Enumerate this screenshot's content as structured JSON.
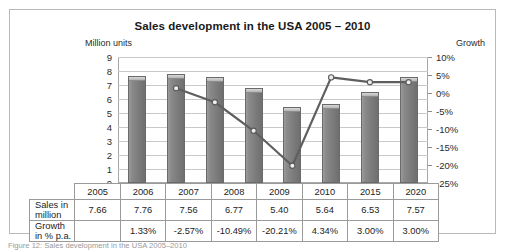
{
  "chart_data": {
    "type": "bar",
    "title": "Sales development in the USA 2005 – 2010",
    "categories": [
      "2005",
      "2006",
      "2007",
      "2008",
      "2009",
      "2010",
      "2015",
      "2020"
    ],
    "series": [
      {
        "name": "Sales in million",
        "type": "bar",
        "axis": "left",
        "values": [
          7.66,
          7.76,
          7.56,
          6.77,
          5.4,
          5.64,
          6.53,
          7.57
        ],
        "labels": [
          "7.66",
          "7.76",
          "7.56",
          "6.77",
          "5.40",
          "5.64",
          "6.53",
          "7.57"
        ],
        "color": "#7d7d7d"
      },
      {
        "name": "Growth in % p.a.",
        "type": "line",
        "axis": "right",
        "values": [
          null,
          1.33,
          -2.57,
          -10.49,
          -20.21,
          4.34,
          3.0,
          3.0
        ],
        "labels": [
          "",
          "1.33%",
          "-2.57%",
          "-10.49%",
          "-20.21%",
          "4.34%",
          "3.00%",
          "3.00%"
        ],
        "color": "#5f5f5f"
      }
    ],
    "left_axis": {
      "label": "Million units",
      "min": 0,
      "max": 9,
      "step": 1,
      "ticks": [
        "9",
        "8",
        "7",
        "6",
        "5",
        "4",
        "3",
        "2",
        "1",
        "0"
      ]
    },
    "right_axis": {
      "label": "Growth",
      "min": -25,
      "max": 10,
      "step": 5,
      "ticks": [
        "10%",
        "5%",
        "0%",
        "-5%",
        "-10%",
        "-15%",
        "-20%",
        "-25%"
      ]
    },
    "grid": true,
    "legend": "none",
    "xlabel": "",
    "ylabel": "Million units"
  },
  "table": {
    "header_row": [
      "",
      "2005",
      "2006",
      "2007",
      "2008",
      "2009",
      "2010",
      "2015",
      "2020"
    ],
    "rows": [
      {
        "label": "Sales in million",
        "values": [
          "7.66",
          "7.76",
          "7.56",
          "6.77",
          "5.40",
          "5.64",
          "6.53",
          "7.57"
        ]
      },
      {
        "label": "Growth in % p.a.",
        "values": [
          "",
          "1.33%",
          "-2.57%",
          "-10.49%",
          "-20.21%",
          "4.34%",
          "3.00%",
          "3.00%"
        ]
      }
    ]
  },
  "caption": "Figure 12: Sales development in the USA 2005–2010",
  "colors": {
    "bar": "#7d7d7d",
    "bar_highlight": "#d8d8d8",
    "line": "#5f5f5f",
    "grid": "#c9c9c9",
    "frame": "#b9b9b9",
    "text": "#1c1c1c"
  }
}
